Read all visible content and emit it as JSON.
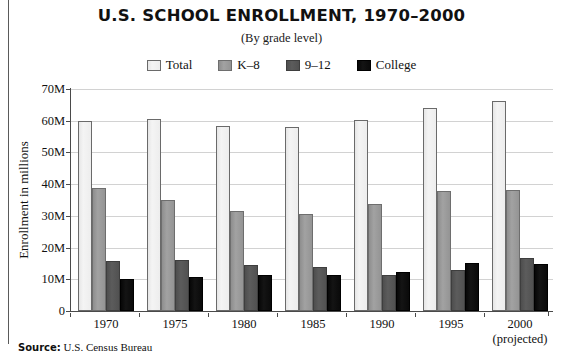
{
  "figure": {
    "title": "U.S. SCHOOL ENROLLMENT, 1970–2000",
    "subtitle": "(By grade level)",
    "source_label": "Source:",
    "source_text": "U.S. Census Bureau"
  },
  "colors": {
    "total": "#f0f0f0",
    "k8": "#9a9a9a",
    "hs": "#555555",
    "college": "#0a0a0a",
    "axis": "#4a4a4a",
    "grid": "#d2d2d2",
    "text": "#111111"
  },
  "chart_data": {
    "type": "bar",
    "title": "U.S. SCHOOL ENROLLMENT, 1970–2000",
    "subtitle": "(By grade level)",
    "xlabel": "",
    "ylabel": "Enrollment in millions",
    "ylim": [
      0,
      70
    ],
    "yticks": [
      0,
      10,
      20,
      30,
      40,
      50,
      60,
      70
    ],
    "ytick_labels": [
      "0",
      "10M",
      "20M",
      "30M",
      "40M",
      "50M",
      "60M",
      "70M"
    ],
    "grid": true,
    "legend_position": "top-center",
    "categories": [
      "1970",
      "1975",
      "1980",
      "1985",
      "1990",
      "1995",
      "2000"
    ],
    "category_sublabels": [
      "",
      "",
      "",
      "",
      "",
      "",
      "(projected)"
    ],
    "units": "millions",
    "series": [
      {
        "name": "Total",
        "color": "#f0f0f0",
        "values": [
          60.0,
          60.5,
          58.3,
          58.1,
          60.2,
          64.1,
          66.2
        ]
      },
      {
        "name": "K–8",
        "color": "#9a9a9a",
        "values": [
          38.9,
          35.0,
          31.5,
          30.7,
          33.6,
          37.8,
          38.3
        ]
      },
      {
        "name": "9–12",
        "color": "#555555",
        "values": [
          15.9,
          16.0,
          14.6,
          14.0,
          11.3,
          12.8,
          16.8
        ]
      },
      {
        "name": "College",
        "color": "#0a0a0a",
        "values": [
          10.0,
          10.8,
          11.4,
          11.2,
          12.4,
          15.2,
          14.8
        ]
      }
    ]
  }
}
